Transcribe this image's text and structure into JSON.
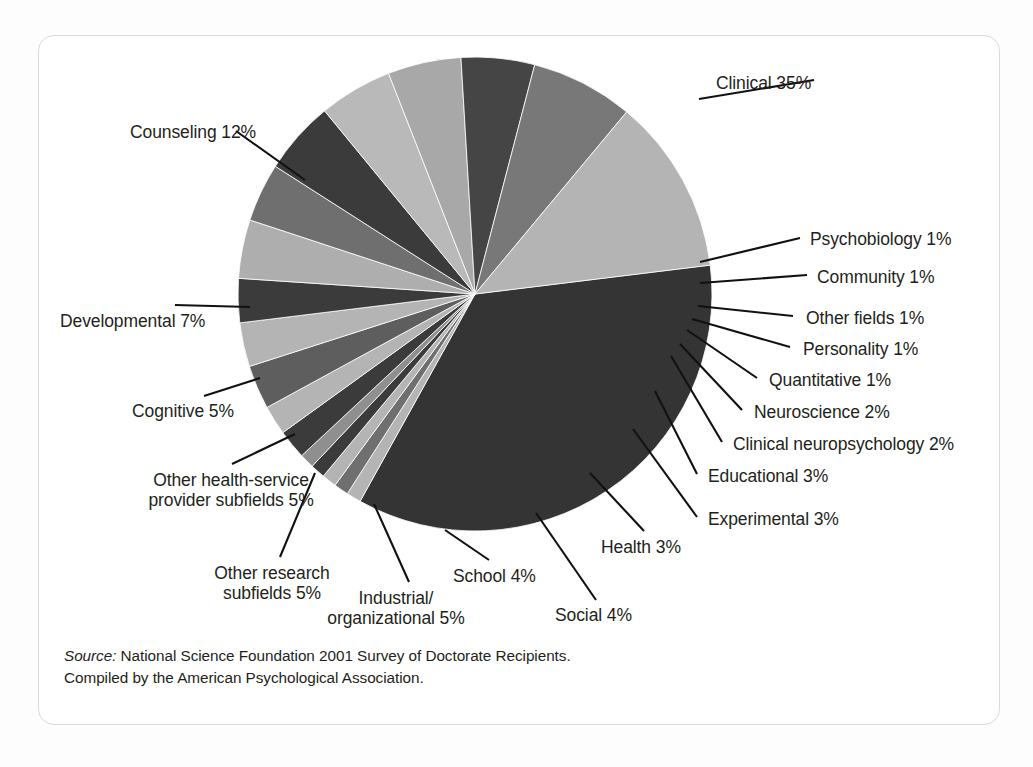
{
  "chart_data": {
    "type": "pie",
    "title": "",
    "subtitle": "",
    "xlabel": "",
    "ylabel": "",
    "legend_position": "none",
    "grid": false,
    "units": "percent",
    "total": 100,
    "start_angle_deg": -7,
    "direction": "clockwise",
    "categories": [
      "Clinical",
      "Psychobiology",
      "Community",
      "Other fields",
      "Personality",
      "Quantitative",
      "Neuroscience",
      "Clinical neuropsychology",
      "Educational",
      "Experimental",
      "Health",
      "Social",
      "School",
      "Industrial/organizational",
      "Other research subfields",
      "Other health-service provider subfields",
      "Cognitive",
      "Developmental",
      "Counseling"
    ],
    "values": [
      35,
      1,
      1,
      1,
      1,
      1,
      2,
      2,
      3,
      3,
      3,
      4,
      4,
      5,
      5,
      5,
      5,
      7,
      12
    ],
    "slices": [
      {
        "label": "Clinical",
        "value": 35,
        "value_text": "35%",
        "color": "#343434"
      },
      {
        "label": "Psychobiology",
        "value": 1,
        "value_text": "1%",
        "color": "#b4b4b4"
      },
      {
        "label": "Community",
        "value": 1,
        "value_text": "1%",
        "color": "#6f6f6f"
      },
      {
        "label": "Other fields",
        "value": 1,
        "value_text": "1%",
        "color": "#b4b4b4"
      },
      {
        "label": "Personality",
        "value": 1,
        "value_text": "1%",
        "color": "#3b3b3b"
      },
      {
        "label": "Quantitative",
        "value": 1,
        "value_text": "1%",
        "color": "#8f8f8f"
      },
      {
        "label": "Neuroscience",
        "value": 2,
        "value_text": "2%",
        "color": "#3b3b3b"
      },
      {
        "label": "Clinical neuropsychology",
        "value": 2,
        "value_text": "2%",
        "color": "#b4b4b4"
      },
      {
        "label": "Educational",
        "value": 3,
        "value_text": "3%",
        "color": "#5e5e5e"
      },
      {
        "label": "Experimental",
        "value": 3,
        "value_text": "3%",
        "color": "#b4b4b4"
      },
      {
        "label": "Health",
        "value": 3,
        "value_text": "3%",
        "color": "#3b3b3b"
      },
      {
        "label": "Social",
        "value": 4,
        "value_text": "4%",
        "color": "#aeaeae"
      },
      {
        "label": "School",
        "value": 4,
        "value_text": "4%",
        "color": "#6f6f6f"
      },
      {
        "label": "Industrial/organizational",
        "value": 5,
        "value_text": "5%",
        "color": "#3b3b3b"
      },
      {
        "label": "Other research subfields",
        "value": 5,
        "value_text": "5%",
        "color": "#b9b9b9"
      },
      {
        "label": "Other health-service provider subfields",
        "value": 5,
        "value_text": "5%",
        "color": "#a8a8a8"
      },
      {
        "label": "Cognitive",
        "value": 5,
        "value_text": "5%",
        "color": "#454545"
      },
      {
        "label": "Developmental",
        "value": 7,
        "value_text": "7%",
        "color": "#787878"
      },
      {
        "label": "Counseling",
        "value": 12,
        "value_text": "12%",
        "color": "#b4b4b4"
      }
    ]
  },
  "labels": {
    "clinical": "Clinical 35%",
    "counseling": "Counseling 12%",
    "developmental": "Developmental 7%",
    "cognitive": "Cognitive 5%",
    "other_health_service_l1": "Other health-service",
    "other_health_service_l2": "provider subfields 5%",
    "other_research_l1": "Other research",
    "other_research_l2": "subfields 5%",
    "industrial_l1": "Industrial/",
    "industrial_l2": "organizational 5%",
    "school": "School 4%",
    "social": "Social 4%",
    "health": "Health 3%",
    "experimental": "Experimental 3%",
    "educational": "Educational 3%",
    "clinical_neuropsychology": "Clinical neuropsychology 2%",
    "neuroscience": "Neuroscience 2%",
    "quantitative": "Quantitative 1%",
    "personality": "Personality 1%",
    "other_fields": "Other fields 1%",
    "community": "Community 1%",
    "psychobiology": "Psychobiology 1%"
  },
  "source": {
    "prefix": "Source:",
    "line1": " National Science Foundation 2001 Survey of Doctorate Recipients.",
    "line2": "Compiled by the American Psychological Association."
  },
  "colors": {
    "page_background": "#fdfdfd",
    "card_background": "#ffffff",
    "card_border": "#d8dadb",
    "text": "#231f20",
    "leader_line": "#111111"
  }
}
